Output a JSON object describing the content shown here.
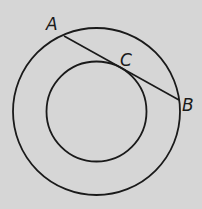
{
  "diagram": {
    "type": "geometry",
    "colors": {
      "background": "#d6d6d6",
      "stroke": "#1a1a1a"
    },
    "outer_circle": {
      "cx": 96.5,
      "cy": 111.5,
      "r": 83.5
    },
    "inner_circle": {
      "cx": 96.5,
      "cy": 111.5,
      "r": 50
    },
    "chord": {
      "from": "A",
      "to": "B",
      "tangent_point": "C"
    },
    "points": [
      {
        "id": "A",
        "label": "A",
        "x": 64,
        "y": 36
      },
      {
        "id": "C",
        "label": "C",
        "x": 123,
        "y": 72
      },
      {
        "id": "B",
        "label": "B",
        "x": 179,
        "y": 100
      }
    ],
    "labels": {
      "A": "A",
      "B": "B",
      "C": "C"
    }
  }
}
